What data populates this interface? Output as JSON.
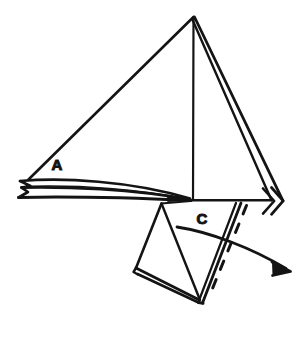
{
  "figure": {
    "kind": "origami-folding-diagram",
    "title": "",
    "background_color": "#ffffff",
    "ink_color": "#141414",
    "width": 303,
    "height": 339
  },
  "labels": [
    {
      "id": "label-a",
      "text": "A",
      "x": 57,
      "y": 170,
      "description": "label on upper-left flap region"
    },
    {
      "id": "label-c",
      "text": "C",
      "x": 197,
      "y": 224,
      "description": "label on lower flap region"
    }
  ],
  "annotations": {
    "fold_line_style": "dashed",
    "fold_line_label": "",
    "arrow_style": "curved-solid-arrow",
    "arrow_direction": "down-right",
    "chevron_marker": "double-chevron-right"
  },
  "shapes": {
    "main_triangle": "large kite/triangle with apex at top",
    "left_flap": "thin layered sliver pointing left",
    "lower_flap": "triangular flap below center",
    "right_edge": "doubled layered edge"
  },
  "colors": {
    "ink": "#141414",
    "paper": "#ffffff"
  }
}
